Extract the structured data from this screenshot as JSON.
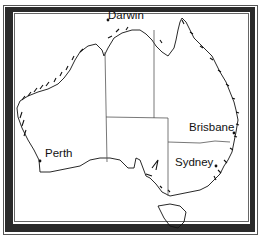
{
  "map": {
    "title": "Australia",
    "colors": {
      "frame": "#2a2a2a",
      "coast": "#111111",
      "borders": "#555555",
      "background": "#ffffff"
    },
    "cities": [
      {
        "name": "Darwin",
        "x": 108,
        "y": 10
      },
      {
        "name": "Brisbane",
        "x": 189,
        "y": 122
      },
      {
        "name": "Sydney",
        "x": 175,
        "y": 157
      },
      {
        "name": "Perth",
        "x": 45,
        "y": 148
      }
    ]
  }
}
